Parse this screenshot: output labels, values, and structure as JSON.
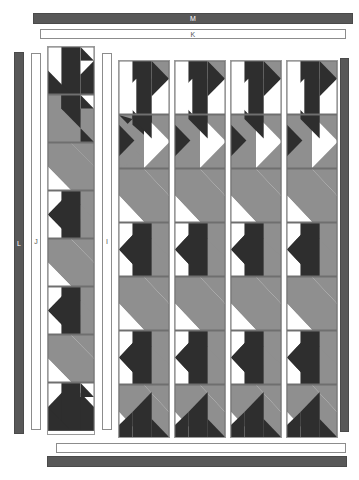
{
  "diagram": {
    "palette": {
      "dark": "#2e2e2e",
      "medium": "#8f8f8f",
      "light": "#ffffff",
      "border_dark": "#585858",
      "outline": "#6f6f6f",
      "background": "#ffffff"
    }
  },
  "borders": {
    "top_outer": {
      "label": "M",
      "style": "dark"
    },
    "top_inner": {
      "label": "K",
      "style": "light"
    },
    "left_outer": {
      "label": "L",
      "style": "dark"
    },
    "left_inner": {
      "label": "J",
      "style": "light"
    },
    "middle_sash": {
      "label": "I",
      "style": "light"
    },
    "bottom_inner": {
      "label": "",
      "style": "light"
    },
    "bottom_outer": {
      "label": "",
      "style": "dark"
    },
    "right_outer": {
      "label": "",
      "style": "dark"
    }
  },
  "left_panel": {
    "name": "narrow-block-column",
    "block_count": 8,
    "blocks": [
      {
        "index": 1,
        "variant": "dark-arrow-up"
      },
      {
        "index": 2,
        "variant": "medium-dark-split"
      },
      {
        "index": 3,
        "variant": "medium-arrow"
      },
      {
        "index": 4,
        "variant": "dark-arrow-left"
      },
      {
        "index": 5,
        "variant": "medium-arrow"
      },
      {
        "index": 6,
        "variant": "dark-arrow-left"
      },
      {
        "index": 7,
        "variant": "medium-arrow"
      },
      {
        "index": 8,
        "variant": "dark-arrow-up"
      }
    ]
  },
  "main_panel": {
    "name": "block-grid",
    "columns": 4,
    "rows": 7,
    "column_labels": [
      "1",
      "2",
      "3",
      "4"
    ],
    "block_variant": "flying-geese-arrow"
  },
  "legend": {
    "dark_fabric": "dark",
    "medium_fabric": "medium",
    "light_fabric": "light"
  }
}
